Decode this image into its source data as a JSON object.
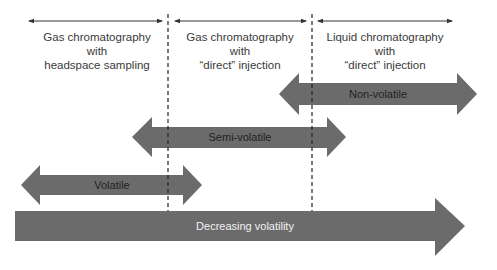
{
  "regions": [
    {
      "label_lines": [
        "Gas chromatography",
        "with",
        "headspace sampling"
      ]
    },
    {
      "label_lines": [
        "Gas chromatography",
        "with",
        "“direct” injection"
      ]
    },
    {
      "label_lines": [
        "Liquid chromatography",
        "with",
        "“direct” injection"
      ]
    }
  ],
  "arrows": {
    "non_volatile": "Non-volatile",
    "semi_volatile": "Semi-volatile",
    "volatile": "Volatile",
    "decreasing": "Decreasing volatility"
  },
  "colors": {
    "arrow_fill": "#6b6b6b",
    "line": "#333333",
    "text": "#3a3a3a"
  }
}
